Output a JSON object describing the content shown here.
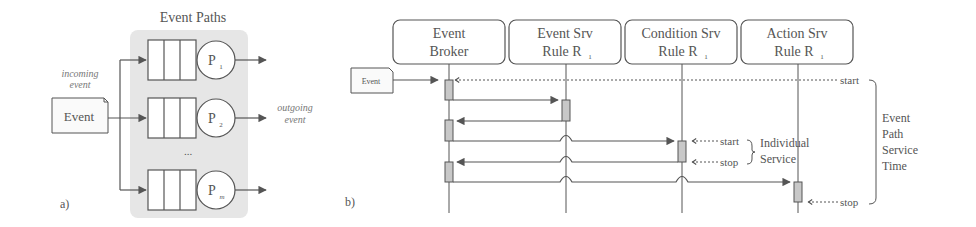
{
  "panel_a": {
    "label": "a)",
    "title": "Event Paths",
    "incoming_label_line1": "incoming",
    "incoming_label_line2": "event",
    "event_box_label": "Event",
    "outgoing_label_line1": "outgoing",
    "outgoing_label_line2": "event",
    "ellipsis": "...",
    "paths": [
      {
        "processor": "P",
        "sub": "1"
      },
      {
        "processor": "P",
        "sub": "2"
      },
      {
        "processor": "P",
        "sub": "m"
      }
    ]
  },
  "panel_b": {
    "label": "b)",
    "event_box_label": "Event",
    "lifelines": [
      {
        "line1": "Event",
        "line2": "Broker",
        "sub": ""
      },
      {
        "line1": "Event Srv",
        "line2": "Rule R",
        "sub": "1"
      },
      {
        "line1": "Condition Srv",
        "line2": "Rule R",
        "sub": "1"
      },
      {
        "line1": "Action Srv",
        "line2": "Rule R",
        "sub": "1"
      }
    ],
    "markers": {
      "path_start": "start",
      "path_stop": "stop",
      "service_start": "start",
      "service_stop": "stop"
    },
    "individual_service_line1": "Individual",
    "individual_service_line2": "Service",
    "path_time_lines": [
      "Event",
      "Path",
      "Service",
      "Time"
    ]
  },
  "colors": {
    "line": "#555555",
    "shade": "#e6e6e6",
    "activation": "#c8c8c8",
    "text": "#555555"
  }
}
